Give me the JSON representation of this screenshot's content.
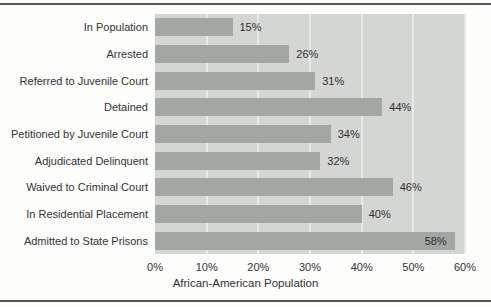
{
  "chart_data": {
    "type": "bar",
    "orientation": "horizontal",
    "title": "",
    "xlabel": "African-American Population",
    "categories": [
      "In Population",
      "Arrested",
      "Referred to Juvenile Court",
      "Detained",
      "Petitioned by Juvenile Court",
      "Adjudicated Delinquent",
      "Waived to Criminal Court",
      "In Residential Placement",
      "Admitted to State Prisons"
    ],
    "values": [
      15,
      26,
      31,
      44,
      34,
      32,
      46,
      40,
      58
    ],
    "value_labels": [
      "15%",
      "26%",
      "31%",
      "44%",
      "34%",
      "32%",
      "46%",
      "40%",
      "58%"
    ],
    "x_ticks": [
      "0%",
      "10%",
      "20%",
      "30%",
      "40%",
      "50%",
      "60%"
    ],
    "xlim": [
      0,
      60
    ],
    "grid": "vertical",
    "legend": "none",
    "colors": {
      "bar": "#a3a7a3",
      "plot_bg": "#d3d6d2",
      "gridline": "#e8eae7",
      "text": "#333333",
      "rule": "#565656"
    }
  }
}
